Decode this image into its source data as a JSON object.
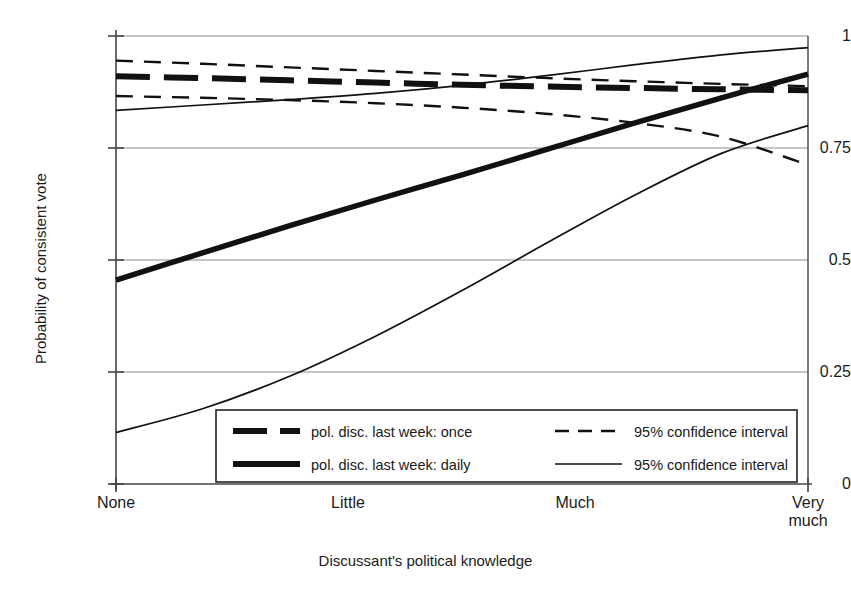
{
  "chart_data": {
    "type": "line",
    "title": "",
    "xlabel": "Discussant's political knowledge",
    "ylabel": "Probability of consistent vote",
    "xlim": [
      0,
      1
    ],
    "ylim": [
      0,
      1
    ],
    "grid": true,
    "xticks": [
      {
        "pos": 0.0,
        "label": "None"
      },
      {
        "pos": 0.333,
        "label": "Little"
      },
      {
        "pos": 0.667,
        "label": "Much"
      },
      {
        "pos": 1.0,
        "label": "Very\nmuch"
      }
    ],
    "xtick_labels": [
      "None",
      "Little",
      "Much",
      "Very much"
    ],
    "yticks": [
      0,
      0.25,
      0.5,
      0.75,
      1
    ],
    "ytick_labels": [
      "0",
      "0.25",
      "0.5",
      "0.75",
      "1"
    ],
    "legend_position": "bottom-center-inside",
    "series": [
      {
        "name": "pol. disc. last week: once",
        "style": "thick-dashed",
        "x": [
          0.0,
          0.125,
          0.25,
          0.375,
          0.5,
          0.625,
          0.75,
          0.875,
          1.0
        ],
        "values": [
          0.91,
          0.906,
          0.901,
          0.896,
          0.891,
          0.887,
          0.884,
          0.881,
          0.879
        ]
      },
      {
        "name": "95% confidence interval",
        "style": "thin-dashed",
        "role": "upper-ci-once",
        "x": [
          0.0,
          0.125,
          0.25,
          0.375,
          0.5,
          0.625,
          0.75,
          0.875,
          1.0
        ],
        "values": [
          0.945,
          0.938,
          0.93,
          0.922,
          0.914,
          0.906,
          0.899,
          0.893,
          0.888
        ]
      },
      {
        "name": "95% confidence interval",
        "style": "thin-dashed",
        "role": "lower-ci-once",
        "x": [
          0.0,
          0.125,
          0.25,
          0.375,
          0.5,
          0.625,
          0.75,
          0.875,
          1.0
        ],
        "values": [
          0.866,
          0.862,
          0.857,
          0.85,
          0.84,
          0.826,
          0.806,
          0.775,
          0.712
        ]
      },
      {
        "name": "pol. disc. last week: daily",
        "style": "thick-solid",
        "x": [
          0.0,
          0.125,
          0.25,
          0.375,
          0.5,
          0.625,
          0.75,
          0.875,
          1.0
        ],
        "values": [
          0.455,
          0.516,
          0.576,
          0.634,
          0.69,
          0.748,
          0.806,
          0.862,
          0.915
        ]
      },
      {
        "name": "95% confidence interval",
        "style": "thin-solid",
        "role": "upper-ci-daily",
        "x": [
          0.0,
          0.125,
          0.25,
          0.375,
          0.5,
          0.625,
          0.75,
          0.875,
          1.0
        ],
        "values": [
          0.834,
          0.846,
          0.858,
          0.872,
          0.89,
          0.912,
          0.936,
          0.958,
          0.974
        ]
      },
      {
        "name": "95% confidence interval",
        "style": "thin-solid",
        "role": "lower-ci-daily",
        "x": [
          0.0,
          0.125,
          0.25,
          0.375,
          0.5,
          0.625,
          0.75,
          0.875,
          1.0
        ],
        "values": [
          0.115,
          0.168,
          0.24,
          0.33,
          0.432,
          0.54,
          0.645,
          0.738,
          0.8
        ]
      }
    ],
    "legend_entries": [
      {
        "label": "pol. disc. last week: once",
        "style": "thick-dashed"
      },
      {
        "label": "95% confidence interval",
        "style": "thin-dashed"
      },
      {
        "label": "pol. disc. last week: daily",
        "style": "thick-solid"
      },
      {
        "label": "95% confidence interval",
        "style": "thin-solid"
      }
    ],
    "colors": {
      "line": "#111111",
      "grid": "#888888",
      "axis": "#555555",
      "background": "#ffffff"
    }
  }
}
